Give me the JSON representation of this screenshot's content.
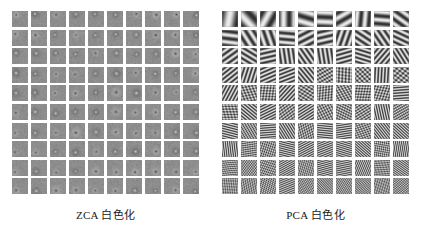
{
  "figure": {
    "background_color": "#ffffff",
    "tile_base_color": "#8d8d8d",
    "panels": [
      {
        "id": "zca",
        "caption": "ZCA 白色化",
        "method": "ZCA",
        "label_suffix": "白色化",
        "rows": 10,
        "columns": 10,
        "tile_count": 100,
        "tile_size_px": 16,
        "filter_type": "center-surround",
        "description": "localized center-surround whitening filters"
      },
      {
        "id": "pca",
        "caption": "PCA 白色化",
        "method": "PCA",
        "label_suffix": "白色化",
        "rows": 10,
        "columns": 10,
        "tile_count": 100,
        "tile_size_px": 16,
        "filter_type": "global-grating",
        "description": "global sinusoidal grating whitening filters of increasing spatial frequency"
      }
    ]
  }
}
